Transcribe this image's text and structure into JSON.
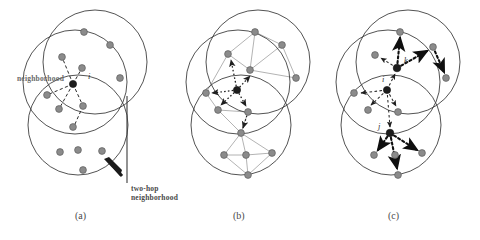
{
  "figure": {
    "type": "diagram",
    "background_color": "#ffffff",
    "node_fill": "#8b8b8b",
    "node_stroke": "#5e5e5e",
    "circle_stroke": "#3f3f3f",
    "dashed_arrow_color": "#2b2b2b",
    "graph_edge_color": "#9a9a9a",
    "dotted_arrow_color": "#1a1a1a",
    "panel_count": 3
  },
  "captions": [
    {
      "id": "a",
      "label": "(a)"
    },
    {
      "id": "b",
      "label": "(b)"
    },
    {
      "id": "c",
      "label": "(c)"
    }
  ],
  "annotations": {
    "neighborhood": "neighborhood",
    "two_hop_line1": "two-hop",
    "two_hop_line2": "neighborhood"
  },
  "node_labels": {
    "panel_a_center": "i",
    "panel_c_upper": "k",
    "panel_c_center": "i",
    "panel_c_lower": "j"
  },
  "panel_a": {
    "id": "a",
    "coverage_circles": [
      {
        "cx": 95,
        "cy": 62,
        "r": 52
      },
      {
        "cx": 75,
        "cy": 82,
        "r": 52
      },
      {
        "cx": 78,
        "cy": 125,
        "r": 50
      }
    ],
    "nodes": [
      {
        "x": 84,
        "y": 32,
        "role": "two-hop"
      },
      {
        "x": 110,
        "y": 45,
        "role": "two-hop"
      },
      {
        "x": 62,
        "y": 57,
        "role": "one-hop"
      },
      {
        "x": 82,
        "y": 68,
        "role": "one-hop"
      },
      {
        "x": 120,
        "y": 78,
        "role": "two-hop"
      },
      {
        "x": 73,
        "y": 84,
        "role": "center"
      },
      {
        "x": 47,
        "y": 95,
        "role": "one-hop"
      },
      {
        "x": 59,
        "y": 109,
        "role": "one-hop"
      },
      {
        "x": 83,
        "y": 106,
        "role": "one-hop"
      },
      {
        "x": 73,
        "y": 127,
        "role": "two-hop"
      },
      {
        "x": 60,
        "y": 152,
        "role": "two-hop"
      },
      {
        "x": 78,
        "y": 150,
        "role": "two-hop"
      },
      {
        "x": 102,
        "y": 151,
        "role": "two-hop"
      },
      {
        "x": 83,
        "y": 170,
        "role": "two-hop"
      },
      {
        "x": 122,
        "y": 45,
        "role": "two-hop"
      }
    ],
    "dashed_links_from_center": [
      {
        "x": 62,
        "y": 57
      },
      {
        "x": 82,
        "y": 68
      },
      {
        "x": 47,
        "y": 95
      },
      {
        "x": 59,
        "y": 109
      },
      {
        "x": 83,
        "y": 106
      },
      {
        "x": 73,
        "y": 127
      }
    ],
    "pointer_arrow": {
      "from_x": 122,
      "from_y": 178,
      "to_x": 103,
      "to_y": 158
    },
    "pointer_line": {
      "x": 127,
      "y1": 96,
      "y2": 183
    }
  },
  "panel_b": {
    "id": "b",
    "coverage_circles": [
      {
        "cx": 258,
        "cy": 62,
        "r": 52
      },
      {
        "cx": 238,
        "cy": 82,
        "r": 52
      },
      {
        "cx": 241,
        "cy": 125,
        "r": 50
      }
    ],
    "nodes": [
      {
        "x": 255,
        "y": 32,
        "role": "two-hop"
      },
      {
        "x": 282,
        "y": 45,
        "role": "two-hop"
      },
      {
        "x": 228,
        "y": 54,
        "role": "one-hop"
      },
      {
        "x": 250,
        "y": 70,
        "role": "one-hop"
      },
      {
        "x": 296,
        "y": 78,
        "role": "two-hop"
      },
      {
        "x": 237,
        "y": 90,
        "role": "center"
      },
      {
        "x": 206,
        "y": 93,
        "role": "one-hop"
      },
      {
        "x": 218,
        "y": 110,
        "role": "one-hop"
      },
      {
        "x": 248,
        "y": 112,
        "role": "one-hop"
      },
      {
        "x": 241,
        "y": 133,
        "role": "two-hop"
      },
      {
        "x": 224,
        "y": 155,
        "role": "two-hop"
      },
      {
        "x": 246,
        "y": 155,
        "role": "two-hop"
      },
      {
        "x": 272,
        "y": 153,
        "role": "two-hop"
      },
      {
        "x": 248,
        "y": 175,
        "role": "two-hop"
      }
    ],
    "graph_edges": [
      [
        255,
        32,
        282,
        45
      ],
      [
        255,
        32,
        250,
        70
      ],
      [
        255,
        32,
        228,
        54
      ],
      [
        282,
        45,
        296,
        78
      ],
      [
        282,
        45,
        250,
        70
      ],
      [
        250,
        70,
        296,
        78
      ],
      [
        250,
        70,
        228,
        54
      ],
      [
        228,
        54,
        206,
        93
      ],
      [
        250,
        70,
        237,
        90
      ],
      [
        206,
        93,
        218,
        110
      ],
      [
        218,
        110,
        248,
        112
      ],
      [
        248,
        112,
        241,
        133
      ],
      [
        218,
        110,
        241,
        133
      ],
      [
        241,
        133,
        224,
        155
      ],
      [
        241,
        133,
        246,
        155
      ],
      [
        241,
        133,
        272,
        153
      ],
      [
        224,
        155,
        246,
        155
      ],
      [
        246,
        155,
        272,
        153
      ],
      [
        224,
        155,
        248,
        175
      ],
      [
        246,
        155,
        248,
        175
      ],
      [
        272,
        153,
        248,
        175
      ],
      [
        237,
        90,
        248,
        112
      ],
      [
        237,
        90,
        218,
        110
      ]
    ],
    "dotted_arrows_from_center": [
      {
        "x": 228,
        "y": 54
      },
      {
        "x": 250,
        "y": 70
      },
      {
        "x": 206,
        "y": 93
      },
      {
        "x": 218,
        "y": 110
      },
      {
        "x": 248,
        "y": 112
      },
      {
        "x": 241,
        "y": 133
      }
    ]
  },
  "panel_c": {
    "id": "c",
    "coverage_circles": [
      {
        "cx": 408,
        "cy": 62,
        "r": 52
      },
      {
        "cx": 388,
        "cy": 82,
        "r": 52
      },
      {
        "cx": 391,
        "cy": 125,
        "r": 50
      }
    ],
    "nodes": [
      {
        "x": 400,
        "y": 32,
        "role": "two-hop"
      },
      {
        "x": 433,
        "y": 47,
        "role": "two-hop"
      },
      {
        "x": 375,
        "y": 55,
        "role": "one-hop"
      },
      {
        "x": 397,
        "y": 68,
        "role": "node-k"
      },
      {
        "x": 446,
        "y": 78,
        "role": "two-hop"
      },
      {
        "x": 387,
        "y": 90,
        "role": "node-i"
      },
      {
        "x": 354,
        "y": 93,
        "role": "one-hop"
      },
      {
        "x": 368,
        "y": 110,
        "role": "one-hop"
      },
      {
        "x": 398,
        "y": 112,
        "role": "one-hop"
      },
      {
        "x": 390,
        "y": 133,
        "role": "node-j"
      },
      {
        "x": 374,
        "y": 155,
        "role": "two-hop"
      },
      {
        "x": 395,
        "y": 155,
        "role": "two-hop"
      },
      {
        "x": 422,
        "y": 153,
        "role": "two-hop"
      },
      {
        "x": 398,
        "y": 175,
        "role": "two-hop"
      }
    ],
    "thick_dotted_arrows": [
      {
        "from_x": 397,
        "from_y": 68,
        "to_x": 400,
        "to_y": 34
      },
      {
        "from_x": 397,
        "from_y": 68,
        "to_x": 377,
        "to_y": 56
      },
      {
        "from_x": 397,
        "from_y": 68,
        "to_x": 431,
        "to_y": 49
      },
      {
        "from_x": 433,
        "from_y": 47,
        "to_x": 445,
        "to_y": 76
      },
      {
        "from_x": 390,
        "from_y": 133,
        "to_x": 376,
        "to_y": 153
      },
      {
        "from_x": 390,
        "from_y": 133,
        "to_x": 420,
        "to_y": 152
      },
      {
        "from_x": 390,
        "from_y": 133,
        "to_x": 397,
        "to_y": 172
      }
    ],
    "dashed_arrows_from_i": [
      {
        "x": 397,
        "y": 68
      },
      {
        "x": 354,
        "y": 93
      },
      {
        "x": 368,
        "y": 110
      },
      {
        "x": 398,
        "y": 112
      },
      {
        "x": 390,
        "y": 133
      }
    ]
  }
}
